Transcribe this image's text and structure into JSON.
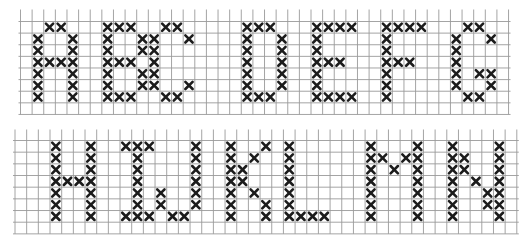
{
  "colors": {
    "grid": "#9a9a9a",
    "stitch": "#1c1c1c",
    "background": "#ffffff"
  },
  "chart_data": {
    "type": "heatmap",
    "panels": [
      {
        "name": "top-panel",
        "columns": 42,
        "rows": 9,
        "letters": [
          {
            "letter": "A",
            "cells": [
              [
                2,
                1
              ],
              [
                3,
                1
              ],
              [
                1,
                2
              ],
              [
                4,
                2
              ],
              [
                1,
                3
              ],
              [
                4,
                3
              ],
              [
                1,
                4
              ],
              [
                2,
                4
              ],
              [
                3,
                4
              ],
              [
                4,
                4
              ],
              [
                1,
                5
              ],
              [
                4,
                5
              ],
              [
                1,
                6
              ],
              [
                4,
                6
              ],
              [
                1,
                7
              ],
              [
                4,
                7
              ]
            ]
          },
          {
            "letter": "B",
            "cells": [
              [
                7,
                1
              ],
              [
                8,
                1
              ],
              [
                9,
                1
              ],
              [
                7,
                2
              ],
              [
                10,
                2
              ],
              [
                7,
                3
              ],
              [
                10,
                3
              ],
              [
                7,
                4
              ],
              [
                8,
                4
              ],
              [
                9,
                4
              ],
              [
                7,
                5
              ],
              [
                10,
                5
              ],
              [
                7,
                6
              ],
              [
                10,
                6
              ],
              [
                7,
                7
              ],
              [
                8,
                7
              ],
              [
                9,
                7
              ]
            ]
          },
          {
            "letter": "C",
            "cells": [
              [
                12,
                1
              ],
              [
                13,
                1
              ],
              [
                11,
                2
              ],
              [
                14,
                2
              ],
              [
                11,
                3
              ],
              [
                11,
                4
              ],
              [
                11,
                5
              ],
              [
                11,
                6
              ],
              [
                14,
                6
              ],
              [
                12,
                7
              ],
              [
                13,
                7
              ]
            ]
          },
          {
            "letter": "D",
            "cells": [
              [
                19,
                1
              ],
              [
                20,
                1
              ],
              [
                21,
                1
              ],
              [
                19,
                2
              ],
              [
                22,
                2
              ],
              [
                19,
                3
              ],
              [
                22,
                3
              ],
              [
                19,
                4
              ],
              [
                22,
                4
              ],
              [
                19,
                5
              ],
              [
                22,
                5
              ],
              [
                19,
                6
              ],
              [
                22,
                6
              ],
              [
                19,
                7
              ],
              [
                20,
                7
              ],
              [
                21,
                7
              ]
            ]
          },
          {
            "letter": "E",
            "cells": [
              [
                25,
                1
              ],
              [
                26,
                1
              ],
              [
                27,
                1
              ],
              [
                28,
                1
              ],
              [
                25,
                2
              ],
              [
                25,
                3
              ],
              [
                25,
                4
              ],
              [
                26,
                4
              ],
              [
                27,
                4
              ],
              [
                25,
                5
              ],
              [
                25,
                6
              ],
              [
                25,
                7
              ],
              [
                26,
                7
              ],
              [
                27,
                7
              ],
              [
                28,
                7
              ]
            ]
          },
          {
            "letter": "F",
            "cells": [
              [
                31,
                1
              ],
              [
                32,
                1
              ],
              [
                33,
                1
              ],
              [
                34,
                1
              ],
              [
                31,
                2
              ],
              [
                31,
                3
              ],
              [
                31,
                4
              ],
              [
                32,
                4
              ],
              [
                33,
                4
              ],
              [
                31,
                5
              ],
              [
                31,
                6
              ],
              [
                31,
                7
              ]
            ]
          },
          {
            "letter": "G",
            "cells": [
              [
                38,
                1
              ],
              [
                39,
                1
              ],
              [
                37,
                2
              ],
              [
                40,
                2
              ],
              [
                37,
                3
              ],
              [
                37,
                4
              ],
              [
                37,
                5
              ],
              [
                39,
                5
              ],
              [
                40,
                5
              ],
              [
                37,
                6
              ],
              [
                40,
                6
              ],
              [
                38,
                7
              ],
              [
                39,
                7
              ]
            ]
          }
        ]
      },
      {
        "name": "bottom-panel",
        "columns": 43,
        "rows": 9,
        "letters": [
          {
            "letter": "H",
            "cells": [
              [
                3,
                1
              ],
              [
                6,
                1
              ],
              [
                3,
                2
              ],
              [
                6,
                2
              ],
              [
                3,
                3
              ],
              [
                6,
                3
              ],
              [
                3,
                4
              ],
              [
                4,
                4
              ],
              [
                5,
                4
              ],
              [
                6,
                4
              ],
              [
                3,
                5
              ],
              [
                6,
                5
              ],
              [
                3,
                6
              ],
              [
                6,
                6
              ],
              [
                3,
                7
              ],
              [
                6,
                7
              ]
            ]
          },
          {
            "letter": "I",
            "cells": [
              [
                9,
                1
              ],
              [
                10,
                1
              ],
              [
                11,
                1
              ],
              [
                10,
                2
              ],
              [
                10,
                3
              ],
              [
                10,
                4
              ],
              [
                10,
                5
              ],
              [
                10,
                6
              ],
              [
                9,
                7
              ],
              [
                10,
                7
              ],
              [
                11,
                7
              ]
            ]
          },
          {
            "letter": "J",
            "cells": [
              [
                15,
                1
              ],
              [
                15,
                2
              ],
              [
                15,
                3
              ],
              [
                15,
                4
              ],
              [
                15,
                5
              ],
              [
                12,
                5
              ],
              [
                15,
                6
              ],
              [
                12,
                6
              ],
              [
                13,
                7
              ],
              [
                14,
                7
              ]
            ]
          },
          {
            "letter": "K",
            "cells": [
              [
                18,
                1
              ],
              [
                21,
                1
              ],
              [
                18,
                2
              ],
              [
                20,
                2
              ],
              [
                18,
                3
              ],
              [
                19,
                3
              ],
              [
                18,
                4
              ],
              [
                19,
                4
              ],
              [
                18,
                5
              ],
              [
                20,
                5
              ],
              [
                18,
                6
              ],
              [
                21,
                6
              ],
              [
                18,
                7
              ],
              [
                21,
                7
              ]
            ]
          },
          {
            "letter": "L",
            "cells": [
              [
                23,
                1
              ],
              [
                23,
                2
              ],
              [
                23,
                3
              ],
              [
                23,
                4
              ],
              [
                23,
                5
              ],
              [
                23,
                6
              ],
              [
                23,
                7
              ],
              [
                24,
                7
              ],
              [
                25,
                7
              ],
              [
                26,
                7
              ]
            ]
          },
          {
            "letter": "M",
            "cells": [
              [
                30,
                1
              ],
              [
                34,
                1
              ],
              [
                30,
                2
              ],
              [
                31,
                2
              ],
              [
                33,
                2
              ],
              [
                34,
                2
              ],
              [
                30,
                3
              ],
              [
                32,
                3
              ],
              [
                34,
                3
              ],
              [
                30,
                4
              ],
              [
                34,
                4
              ],
              [
                30,
                5
              ],
              [
                34,
                5
              ],
              [
                30,
                6
              ],
              [
                34,
                6
              ],
              [
                30,
                7
              ],
              [
                34,
                7
              ]
            ]
          },
          {
            "letter": "N",
            "cells": [
              [
                37,
                1
              ],
              [
                41,
                1
              ],
              [
                37,
                2
              ],
              [
                38,
                2
              ],
              [
                41,
                2
              ],
              [
                37,
                3
              ],
              [
                38,
                3
              ],
              [
                41,
                3
              ],
              [
                37,
                4
              ],
              [
                39,
                4
              ],
              [
                41,
                4
              ],
              [
                37,
                5
              ],
              [
                40,
                5
              ],
              [
                41,
                5
              ],
              [
                37,
                6
              ],
              [
                40,
                6
              ],
              [
                41,
                6
              ],
              [
                37,
                7
              ],
              [
                41,
                7
              ]
            ]
          }
        ]
      }
    ]
  }
}
